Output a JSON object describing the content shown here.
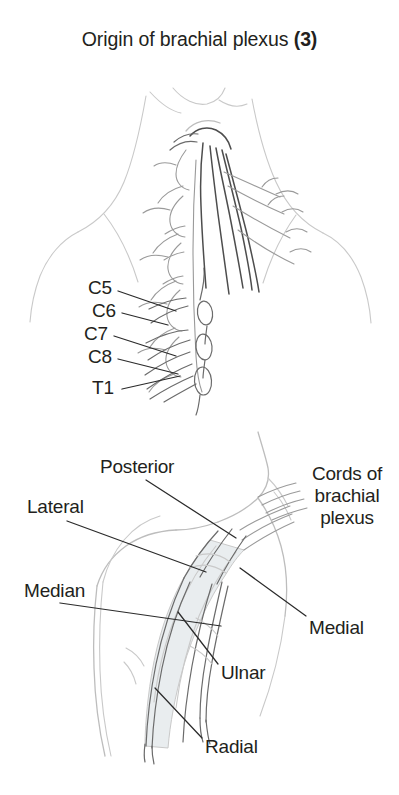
{
  "figure": {
    "title_text": "Origin of brachial plexus ",
    "title_count": "(3)",
    "colors": {
      "text": "#231f20",
      "leader_line": "#2b2b2b",
      "anatomy_line": "#c9c9c9",
      "anatomy_line_dark": "#6e6e6e",
      "nerve_trunk": "#4a4a4a",
      "artery_fill": "#e8ecee",
      "background": "#ffffff"
    }
  },
  "upper_diagram": {
    "name": "cervical-spinal-nerve-roots",
    "labels": [
      {
        "id": "c5",
        "text": "C5"
      },
      {
        "id": "c6",
        "text": "C6"
      },
      {
        "id": "c7",
        "text": "C7"
      },
      {
        "id": "c8",
        "text": "C8"
      },
      {
        "id": "t1",
        "text": "T1"
      }
    ]
  },
  "lower_diagram": {
    "name": "cords-of-brachial-plexus",
    "group_label": {
      "line1": "Cords of",
      "line2": "brachial",
      "line3": "plexus"
    },
    "labels": [
      {
        "id": "posterior",
        "text": "Posterior"
      },
      {
        "id": "lateral",
        "text": "Lateral"
      },
      {
        "id": "medial",
        "text": "Medial"
      },
      {
        "id": "median",
        "text": "Median"
      },
      {
        "id": "ulnar",
        "text": "Ulnar"
      },
      {
        "id": "radial",
        "text": "Radial"
      }
    ]
  }
}
